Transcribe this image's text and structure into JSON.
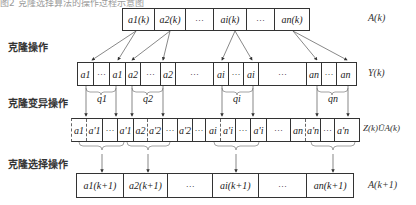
{
  "caption": "图2 克隆选择算法的操作过程示意图",
  "stage_labels": {
    "clone": "克隆操作",
    "mutation": "克隆变异操作",
    "selection": "克隆选择操作"
  },
  "row_labels": {
    "A": "A(k)",
    "Y": "Y(k)",
    "Z": "Z(k)ŨA(k)",
    "A_next": "A(k+1)"
  },
  "rows": {
    "A": [
      "a1(k)",
      "a2(k)",
      "···",
      "ai(k)",
      "···",
      "an(k)"
    ],
    "Y": [
      "a1",
      "···",
      "a1",
      "a2",
      "···",
      "a2",
      "···",
      "ai",
      "···",
      "ai",
      "···",
      "an",
      "···",
      "an"
    ],
    "Z": [
      "a1",
      "a'1",
      "···",
      "a'1",
      "a2",
      "a'2",
      "···",
      "a'2",
      "···",
      "ai",
      "a'i",
      "···",
      "a'i",
      "···",
      "an",
      "a'n",
      "···",
      "a'n"
    ],
    "A_next": [
      "a1(k+1)",
      "a2(k+1)",
      "···",
      "ai(k+1)",
      "···",
      "an(k+1)"
    ]
  },
  "q_labels": [
    "q1",
    "q2",
    "qi",
    "qn"
  ]
}
